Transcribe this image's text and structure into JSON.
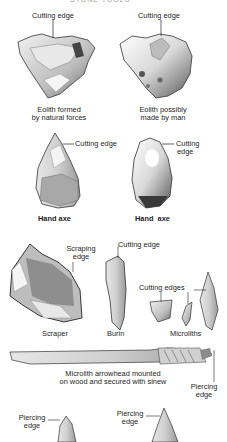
{
  "heading": "STONE TOOLS",
  "eoliths": {
    "natural": {
      "pointer": "Cutting edge",
      "caption_line1": "Eolith formed",
      "caption_line2": "by natural forces"
    },
    "man": {
      "pointer": "Cutting edge",
      "caption_line1": "Eolith possibly",
      "caption_line2": "made by man"
    }
  },
  "hand_axes": {
    "left": {
      "pointer": "Cutting edge",
      "caption": "Hand axe"
    },
    "right": {
      "pointer_line1": "Cutting",
      "pointer_line2": "edge",
      "caption": "Hand  axe"
    }
  },
  "small_tools": {
    "scraper": {
      "pointer_line1": "Scraping",
      "pointer_line2": "edge",
      "caption": "Scraper"
    },
    "burin": {
      "pointer": "Cutting edge",
      "caption": "Burin"
    },
    "microliths": {
      "pointer": "Cutting edges",
      "caption": "Microliths"
    }
  },
  "arrow": {
    "caption_line1": "Microlith arrowhead mounted",
    "caption_line2": "on wood and secured with sinew",
    "pointer_line1": "Piercing",
    "pointer_line2": "edge"
  },
  "points": {
    "left": {
      "pointer_line1": "Piercing",
      "pointer_line2": "edge"
    },
    "right": {
      "pointer_line1": "Piercing",
      "pointer_line2": "edge"
    }
  },
  "colors": {
    "ink": "#1e1e1e",
    "shade": "#9c9c9c",
    "light": "#dcdcdc",
    "background": "#ffffff"
  }
}
